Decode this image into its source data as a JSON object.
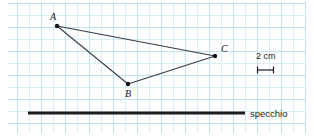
{
  "figure": {
    "background_color": "#ffffff",
    "grid": {
      "minor_color": "#d8f0f5",
      "major_color": "#bfe3ec",
      "minor_spacing_px": 12,
      "major_spacing_px": 24
    },
    "points": [
      {
        "label": "A",
        "x": 57,
        "y": 26,
        "label_x": 50,
        "label_y": 12
      },
      {
        "label": "B",
        "x": 128,
        "y": 84,
        "label_x": 125,
        "label_y": 89
      },
      {
        "label": "C",
        "x": 215,
        "y": 56,
        "label_x": 221,
        "label_y": 44
      }
    ],
    "segments": [
      {
        "name": "A-C",
        "from": "A",
        "to": "C"
      },
      {
        "name": "A-B",
        "from": "A",
        "to": "B"
      },
      {
        "name": "B-C",
        "from": "B",
        "to": "C"
      }
    ],
    "line_color": "#3a3a48",
    "point_color": "#101018",
    "mirror": {
      "label": "specchio",
      "color": "#1a1a20",
      "x1": 28,
      "x2": 245,
      "y": 113,
      "thickness": 3,
      "label_x": 250,
      "label_y": 110
    },
    "scale_bar": {
      "label": "2 cm",
      "x1": 257,
      "x2": 274,
      "y": 70,
      "cap_height": 7,
      "color": "#1a1a22",
      "label_x": 256,
      "label_y": 52
    }
  }
}
